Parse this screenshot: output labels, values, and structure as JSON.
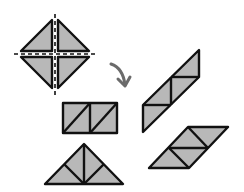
{
  "diagram": {
    "colors": {
      "fill": "#b8b8b8",
      "outline": "#111111",
      "arrow": "#6b6b6b",
      "background": "#ffffff"
    },
    "figures": [
      {
        "name": "source-square",
        "pieces": 4,
        "shape": "square rotated 45° divided by dashed cut lines"
      },
      {
        "name": "rectangle-arrangement",
        "pieces": 4,
        "shape": "rectangle"
      },
      {
        "name": "tall-parallelogram-arrangement",
        "pieces": 4,
        "shape": "parallelogram"
      },
      {
        "name": "triangle-arrangement",
        "pieces": 4,
        "shape": "triangle"
      },
      {
        "name": "wide-parallelogram-arrangement",
        "pieces": 4,
        "shape": "parallelogram"
      }
    ],
    "arrow": {
      "icon": "curved-arrow-icon",
      "meaning": "transform"
    }
  }
}
